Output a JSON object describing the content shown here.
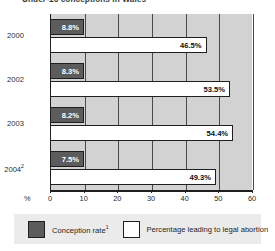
{
  "chart_data": {
    "type": "bar",
    "orientation": "horizontal",
    "title": "Under-16 conceptions in Wales",
    "xlabel": "%",
    "ylabel": "",
    "xlim": [
      0,
      60
    ],
    "xticks": [
      0,
      10,
      20,
      30,
      40,
      50,
      60
    ],
    "grid": true,
    "legend_position": "bottom",
    "categories": [
      "2000",
      "2002",
      "2003",
      "2004"
    ],
    "category_labels": [
      "2000",
      "2002",
      "2003",
      "2004²"
    ],
    "series": [
      {
        "name": "Conception rate¹",
        "key": "conception_rate",
        "color": "#5c5c5c",
        "values": [
          8.8,
          8.3,
          8.2,
          7.5
        ],
        "value_labels": [
          "8.8%",
          "8.3%",
          "8.2%",
          "7.5%"
        ]
      },
      {
        "name": "Percentage leading to legal abortion",
        "key": "abortion_pct",
        "color": "#ffffff",
        "values": [
          46.5,
          53.5,
          54.4,
          49.3
        ],
        "value_labels": [
          "46.5%",
          "53.5%",
          "54.4%",
          "49.3%"
        ]
      }
    ]
  },
  "axis": {
    "unit_label": "%",
    "tick_labels": [
      "0",
      "10",
      "20",
      "30",
      "40",
      "50",
      "60"
    ]
  },
  "legend": {
    "items": [
      {
        "label": "Conception rate",
        "superscript": "1",
        "swatch": "dark"
      },
      {
        "label": "Percentage leading to legal abortion",
        "superscript": "",
        "swatch": "light"
      }
    ]
  },
  "groups": [
    {
      "year": "2000",
      "year_sup": "",
      "dark_value": "8.8%",
      "light_value": "46.5%"
    },
    {
      "year": "2002",
      "year_sup": "",
      "dark_value": "8.3%",
      "light_value": "53.5%"
    },
    {
      "year": "2003",
      "year_sup": "",
      "dark_value": "8.2%",
      "light_value": "54.4%"
    },
    {
      "year": "2004",
      "year_sup": "2",
      "dark_value": "7.5%",
      "light_value": "49.3%"
    }
  ],
  "colors": {
    "series_dark": "#5c5c5c",
    "series_light": "#ffffff",
    "plot_background": "#d2d2d2",
    "legend_background": "#ebebeb",
    "axis": "#1f1f1f"
  }
}
